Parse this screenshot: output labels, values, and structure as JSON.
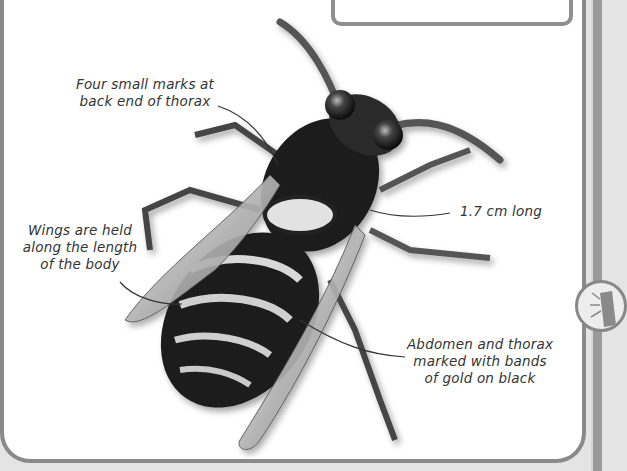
{
  "page": {
    "labels": [
      {
        "id": "thorax-marks",
        "text_line1": "Four small marks at",
        "text_line2": "back end of thorax"
      },
      {
        "id": "wings",
        "text_line1": "Wings are held",
        "text_line2": "along the length",
        "text_line3": "of the body"
      },
      {
        "id": "length",
        "text_line1": "1.7 cm long"
      },
      {
        "id": "abdomen",
        "text_line1": "Abdomen and thorax",
        "text_line2": "marked with bands",
        "text_line3": "of gold on black"
      }
    ]
  },
  "side_tab": {
    "icon": "insect-icon"
  },
  "colors": {
    "border": "#8a8a8a",
    "background": "#ffffff",
    "outer": "#e4e4e4",
    "text": "#333333"
  }
}
